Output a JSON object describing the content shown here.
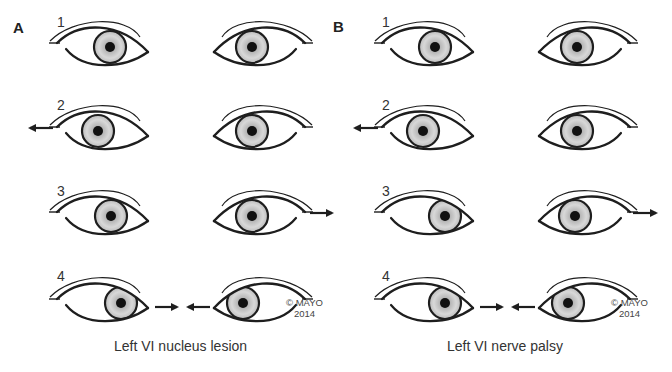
{
  "figure": {
    "panels": [
      {
        "letter": "A",
        "caption": "Left VI nucleus lesion",
        "copyright": [
          "© MAYO",
          "2014"
        ],
        "offset_x": 0,
        "rows": [
          {
            "number": "1",
            "y": 47,
            "left_iris_x": 110,
            "right_iris_x": 252,
            "arrows": []
          },
          {
            "number": "2",
            "y": 131,
            "left_iris_x": 98,
            "right_iris_x": 252,
            "arrows": [
              {
                "from": 53,
                "to": 28,
                "y": 128
              }
            ]
          },
          {
            "number": "3",
            "y": 216,
            "left_iris_x": 111,
            "right_iris_x": 252,
            "arrows": [
              {
                "from": 310,
                "to": 334,
                "y": 213
              }
            ]
          },
          {
            "number": "4",
            "y": 303,
            "left_iris_x": 121,
            "right_iris_x": 243,
            "arrows": [
              {
                "from": 155,
                "to": 179,
                "y": 307
              },
              {
                "from": 210,
                "to": 186,
                "y": 307
              }
            ]
          }
        ]
      },
      {
        "letter": "B",
        "caption": "Left VI nerve palsy",
        "copyright": [
          "© MAYO",
          "2014"
        ],
        "offset_x": 325,
        "rows": [
          {
            "number": "1",
            "y": 47,
            "left_iris_x": 110,
            "right_iris_x": 252,
            "arrows": []
          },
          {
            "number": "2",
            "y": 131,
            "left_iris_x": 98,
            "right_iris_x": 252,
            "arrows": [
              {
                "from": 53,
                "to": 28,
                "y": 128
              }
            ]
          },
          {
            "number": "3",
            "y": 216,
            "left_iris_x": 120,
            "right_iris_x": 250,
            "arrows": [
              {
                "from": 308,
                "to": 333,
                "y": 213
              }
            ]
          },
          {
            "number": "4",
            "y": 303,
            "left_iris_x": 120,
            "right_iris_x": 243,
            "arrows": [
              {
                "from": 155,
                "to": 179,
                "y": 307
              },
              {
                "from": 210,
                "to": 186,
                "y": 307
              }
            ]
          }
        ]
      }
    ],
    "colors": {
      "line": "#1e1e1e",
      "iris_edge": "#9a9a9a",
      "iris_mid": "#cfcfcf",
      "pupil": "#111111"
    }
  }
}
